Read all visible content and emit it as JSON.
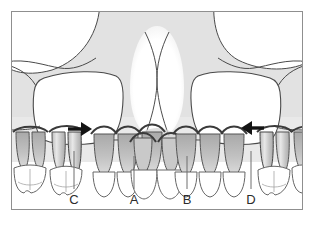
{
  "figure": {
    "kind": "anatomical-illustration",
    "background_color": "#ffffff",
    "frame_border_color": "#8f8f8f",
    "bone_fill": "#e0e0e0",
    "cavity_fill": "#ffffff",
    "outline_color": "#3a3a3a",
    "root_fill": "#b8b8b8",
    "crown_fill": "#ffffff",
    "arrow_color": "#141414",
    "leader_color": "#6e6e6e",
    "label_color": "#2b2b2b"
  },
  "labels": [
    {
      "id": "label-c",
      "text": "C",
      "x": 73,
      "y": 201,
      "leader_x": 73,
      "leader_top": 150,
      "leader_bottom": 188
    },
    {
      "id": "label-a",
      "text": "A",
      "x": 133,
      "y": 201,
      "leader_x": 133,
      "leader_top": 155,
      "leader_bottom": 188
    },
    {
      "id": "label-b",
      "text": "B",
      "x": 186,
      "y": 201,
      "leader_x": 186,
      "leader_top": 155,
      "leader_bottom": 188
    },
    {
      "id": "label-d",
      "text": "D",
      "x": 250,
      "y": 201,
      "leader_x": 250,
      "leader_top": 150,
      "leader_bottom": 188
    }
  ],
  "arrows": [
    {
      "id": "arrow-right",
      "direction": "right",
      "x": 68,
      "y": 129,
      "length": 18
    },
    {
      "id": "arrow-left",
      "direction": "left",
      "x": 238,
      "y": 128,
      "length": 18
    }
  ],
  "regions": [
    {
      "id": "orbit-left",
      "name": "left orbit"
    },
    {
      "id": "orbit-right",
      "name": "right orbit"
    },
    {
      "id": "maxillary-sinus-left",
      "name": "left maxillary sinus"
    },
    {
      "id": "maxillary-sinus-right",
      "name": "right maxillary sinus"
    },
    {
      "id": "nasal-cavity",
      "name": "nasal cavity"
    },
    {
      "id": "nasal-septum",
      "name": "nasal septum"
    },
    {
      "id": "alveolar-bone",
      "name": "alveolar bone"
    }
  ]
}
